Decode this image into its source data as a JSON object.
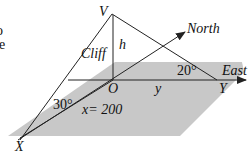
{
  "diagram": {
    "labels": {
      "V": "V",
      "O": "O",
      "X": "X",
      "Y": "Y",
      "h": "h",
      "y": "y",
      "cliff": "Cliff",
      "north": "North",
      "east": "East",
      "x_eq": "x= 200",
      "angle_30": "30°",
      "angle_20": "20°",
      "cut_text_1": "o",
      "cut_text_2": "e"
    },
    "colors": {
      "plane": "#c8c8c8",
      "line": "#222222"
    }
  }
}
